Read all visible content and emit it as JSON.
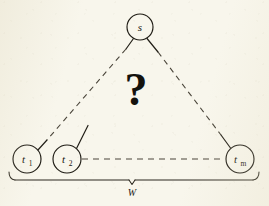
{
  "figure": {
    "kind": "graph-diagram",
    "background_color": "#f8f6ec",
    "ink_color": "#1d1a13",
    "query_symbol": "?",
    "brace_label": "W"
  },
  "nodes": [
    {
      "id": "s",
      "label": "s",
      "subscript": "",
      "cx": 140,
      "cy": 27,
      "r": 13,
      "role": "source"
    },
    {
      "id": "t1",
      "label": "t",
      "subscript": "1",
      "cx": 27,
      "cy": 159,
      "r": 14,
      "role": "target"
    },
    {
      "id": "t2",
      "label": "t",
      "subscript": "2",
      "cx": 67,
      "cy": 159,
      "r": 14,
      "role": "target"
    },
    {
      "id": "tm",
      "label": "t",
      "subscript": "m",
      "cx": 240,
      "cy": 159,
      "r": 14,
      "role": "target"
    }
  ],
  "edges": [
    {
      "id": "s-t1",
      "from": "s",
      "to": "t1",
      "style": "dashed-with-solid-ends"
    },
    {
      "id": "s-tm",
      "from": "s",
      "to": "tm",
      "style": "dashed-with-solid-ends"
    },
    {
      "id": "t2-tm",
      "from": "t2",
      "to": "tm",
      "style": "dashed"
    },
    {
      "id": "t2-stub",
      "from": "t2",
      "to": "",
      "style": "solid-stub"
    }
  ],
  "annotations": {
    "center_query": "?",
    "span_brace": "W"
  }
}
